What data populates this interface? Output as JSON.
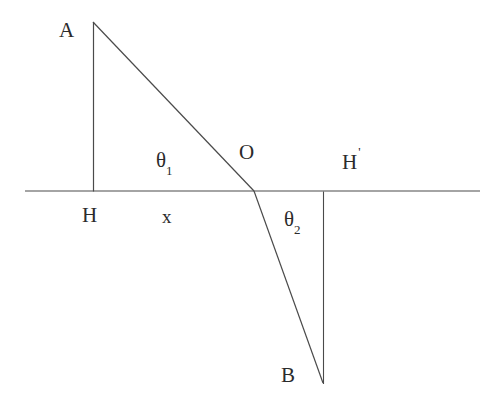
{
  "figure": {
    "background_color": "#ffffff",
    "stroke_color": "#4a4a4a",
    "text_color": "#2b2b2b",
    "labels": {
      "point_a": "A",
      "point_o": "O",
      "point_b": "B",
      "foot_h": "H",
      "foot_h_prime": "H",
      "h_prime_mark": "'",
      "distance_x": "x",
      "theta": "θ",
      "theta1_sub": "1",
      "theta2_sub": "2"
    }
  },
  "chart_data": {
    "type": "line",
    "title": "",
    "xlabel": "",
    "ylabel": "",
    "grid": false,
    "legend": null,
    "xlim": [
      0,
      498
    ],
    "ylim": [
      408,
      0
    ],
    "annotations": [
      {
        "name": "A",
        "text": "A",
        "x": 66,
        "y": 31
      },
      {
        "name": "O",
        "text": "O",
        "x": 247,
        "y": 153
      },
      {
        "name": "H-prime",
        "text": "H'",
        "x": 350,
        "y": 160
      },
      {
        "name": "theta1",
        "text": "θ₁",
        "x": 168,
        "y": 163
      },
      {
        "name": "H",
        "text": "H",
        "x": 90,
        "y": 214
      },
      {
        "name": "x",
        "text": "x",
        "x": 169,
        "y": 216
      },
      {
        "name": "theta2",
        "text": "θ₂",
        "x": 296,
        "y": 220
      },
      {
        "name": "B",
        "text": "B",
        "x": 288,
        "y": 376
      }
    ],
    "series": [
      {
        "name": "interface-line",
        "x": [
          25,
          480
        ],
        "values": [
          191,
          191
        ]
      },
      {
        "name": "normal-AH",
        "x": [
          93,
          93
        ],
        "values": [
          22,
          191
        ]
      },
      {
        "name": "incident-ray-AO",
        "x": [
          93,
          254
        ],
        "values": [
          22,
          191
        ]
      },
      {
        "name": "refracted-ray-OB",
        "x": [
          254,
          323
        ],
        "values": [
          191,
          383
        ]
      },
      {
        "name": "normal-BH-prime",
        "x": [
          323,
          323
        ],
        "values": [
          191,
          383
        ]
      }
    ]
  }
}
